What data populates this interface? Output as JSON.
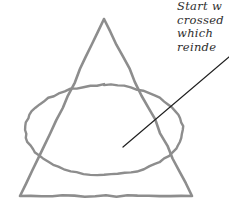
{
  "canvas": {
    "width": 229,
    "height": 202,
    "background": "#ffffff"
  },
  "sketch": {
    "stroke_color": "#8d8d8d",
    "stroke_color_dark": "#6f6f6f",
    "leader_color": "#1f1f1f",
    "triangle": {
      "name": "triangle",
      "apex": [
        104,
        19
      ],
      "bottom_left": [
        20,
        196
      ],
      "bottom_right": [
        192,
        196
      ],
      "stroke_width": 2.6
    },
    "ellipse": {
      "name": "ellipse",
      "center": [
        104,
        130
      ],
      "rx": 79,
      "ry": 45,
      "stroke_width": 2.4
    },
    "leader_line": {
      "name": "leader-line",
      "from": [
        123,
        147
      ],
      "to": [
        229,
        57
      ],
      "stroke_width": 1.2
    }
  },
  "annotation": {
    "lines": [
      "Start w",
      "crossed",
      "which",
      "reinde"
    ],
    "color": "#2e2e2e",
    "clipped_at_right_edge": true
  }
}
